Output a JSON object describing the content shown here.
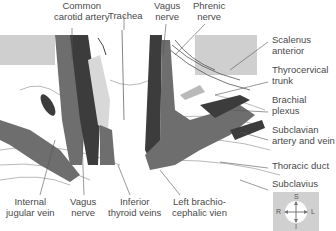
{
  "figure": {
    "labels_top": [
      {
        "id": "common-carotid-artery",
        "lines": [
          "Common",
          "carotid artery"
        ]
      },
      {
        "id": "trachea",
        "lines": [
          "Trachea"
        ]
      },
      {
        "id": "vagus-nerve-top",
        "lines": [
          "Vagus",
          "nerve"
        ]
      },
      {
        "id": "phrenic-nerve",
        "lines": [
          "Phrenic",
          "nerve"
        ]
      }
    ],
    "labels_right": [
      {
        "id": "scalenus-anterior",
        "lines": [
          "Scalenus",
          "anterior"
        ]
      },
      {
        "id": "thyrocervical-trunk",
        "lines": [
          "Thyrocervical",
          "trunk"
        ]
      },
      {
        "id": "brachial-plexus",
        "lines": [
          "Brachial",
          "plexus"
        ]
      },
      {
        "id": "subclavian-artery-vein",
        "lines": [
          "Subclavian",
          "artery and vein"
        ]
      },
      {
        "id": "thoracic-duct",
        "lines": [
          "Thoracic duct"
        ]
      },
      {
        "id": "subclavius",
        "lines": [
          "Subclavius"
        ]
      }
    ],
    "labels_bottom": [
      {
        "id": "internal-jugular-vein",
        "lines": [
          "Internal",
          "jugular vein"
        ]
      },
      {
        "id": "vagus-nerve-bottom",
        "lines": [
          "Vagus",
          "nerve"
        ]
      },
      {
        "id": "inferior-thyroid-veins",
        "lines": [
          "Inferior",
          "thyroid veins"
        ]
      },
      {
        "id": "left-brachiocephalic-vein",
        "lines": [
          "Left brachio-",
          "cephalic vien"
        ]
      }
    ],
    "compass": {
      "top": "S",
      "bottom": "I",
      "left": "R",
      "right": "L"
    },
    "colors": {
      "dark_vessel": "#3c3c3c",
      "mid_vessel": "#6e6e6e",
      "muscle_light": "#b9b9b9",
      "background_panel": "#cfcfcf",
      "leader_line": "#555555"
    }
  }
}
